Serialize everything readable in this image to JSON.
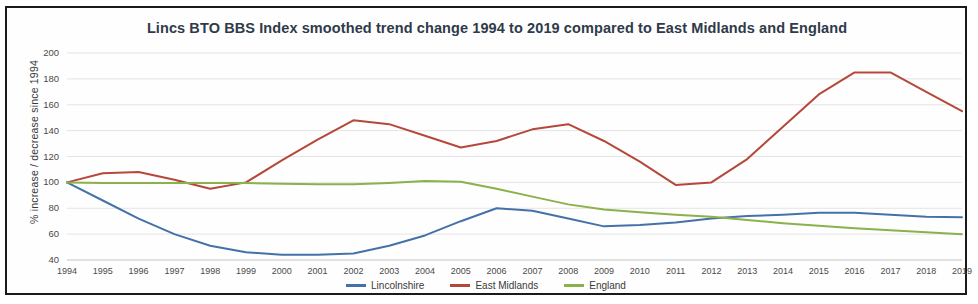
{
  "chart_data": {
    "type": "line",
    "title": "Lincs BTO BBS Index smoothed trend change 1994 to 2019 compared to East Midlands and England",
    "xlabel": "",
    "ylabel": "% increase / decrease since 1994",
    "ylim": [
      40,
      200
    ],
    "ytick_values": [
      40,
      60,
      80,
      100,
      120,
      140,
      160,
      180,
      200
    ],
    "grid": true,
    "legend_position": "bottom",
    "categories": [
      "1994",
      "1995",
      "1996",
      "1997",
      "1998",
      "1999",
      "2000",
      "2001",
      "2002",
      "2003",
      "2004",
      "2005",
      "2006",
      "2007",
      "2008",
      "2009",
      "2010",
      "2011",
      "2012",
      "2013",
      "2014",
      "2015",
      "2016",
      "2017",
      "2018",
      "2019"
    ],
    "series": [
      {
        "name": "Lincolnshire",
        "color": "#4472a8",
        "values": [
          100,
          86,
          72,
          60,
          51,
          46,
          44,
          44,
          45,
          51,
          59,
          70,
          80,
          78,
          72,
          66,
          67,
          69,
          72,
          74,
          75,
          76.5,
          76.5,
          75,
          73.5,
          73
        ]
      },
      {
        "name": "East Midlands",
        "color": "#b5483a",
        "values": [
          100,
          107,
          108,
          102,
          95,
          100,
          117,
          133,
          148,
          145,
          136,
          127,
          132,
          141,
          145,
          132,
          116,
          98,
          100,
          118,
          143,
          168,
          185,
          185,
          170,
          155
        ]
      },
      {
        "name": "England",
        "color": "#8bb14a",
        "values": [
          100,
          99.5,
          99.5,
          99.5,
          99.5,
          99.5,
          99,
          98.5,
          98.5,
          99.5,
          101,
          100.5,
          95,
          89,
          83,
          79,
          77,
          75,
          73.5,
          71,
          68.5,
          66.5,
          64.5,
          63,
          61.5,
          60
        ]
      }
    ]
  },
  "legend": {
    "items": [
      {
        "label": "Lincolnshire",
        "color": "#4472a8"
      },
      {
        "label": "East Midlands",
        "color": "#b5483a"
      },
      {
        "label": "England",
        "color": "#8bb14a"
      }
    ]
  }
}
